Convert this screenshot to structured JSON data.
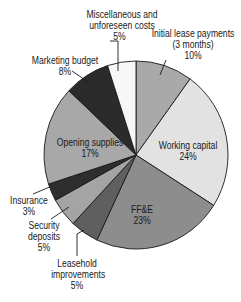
{
  "chart_data": {
    "type": "pie",
    "title": "",
    "start_angle_deg": 0,
    "direction": "clockwise",
    "slices": [
      {
        "label": "Initial lease payments (3 months)",
        "value": 10,
        "pct_text": "10%",
        "color": "#a9a9a9"
      },
      {
        "label": "Working capital",
        "value": 24,
        "pct_text": "24%",
        "color": "#e2e2e2"
      },
      {
        "label": "FF&E",
        "value": 23,
        "pct_text": "23%",
        "color": "#8d8d8d"
      },
      {
        "label": "Leasehold improvements",
        "value": 5,
        "pct_text": "5%",
        "color": "#5f5f5f"
      },
      {
        "label": "Security deposits",
        "value": 5,
        "pct_text": "5%",
        "color": "#a4a4a4"
      },
      {
        "label": "Insurance",
        "value": 3,
        "pct_text": "3%",
        "color": "#2e2e2e"
      },
      {
        "label": "Opening supplies",
        "value": 17,
        "pct_text": "17%",
        "color": "#a8a8a8"
      },
      {
        "label": "Marketing budget",
        "value": 8,
        "pct_text": "8%",
        "color": "#2b2b2b"
      },
      {
        "label": "Miscellaneous and unforeseen costs",
        "value": 5,
        "pct_text": "5%",
        "color": "#f7f7f7"
      }
    ],
    "legend": "none (callout labels)"
  },
  "labels": {
    "lease": {
      "line1": "Initial lease payments",
      "line2": "(3 months)",
      "pct": "10%"
    },
    "working": {
      "line1": "Working capital",
      "pct": "24%"
    },
    "ffe": {
      "line1": "FF&E",
      "pct": "23%"
    },
    "leasehold": {
      "line1": "Leasehold",
      "line2": "improvements",
      "pct": "5%"
    },
    "security": {
      "line1": "Security",
      "line2": "deposits",
      "pct": "5%"
    },
    "insurance": {
      "line1": "Insurance",
      "pct": "3%"
    },
    "opening": {
      "line1": "Opening supplies",
      "pct": "17%"
    },
    "marketing": {
      "line1": "Marketing budget",
      "pct": "8%"
    },
    "misc": {
      "line1": "Miscellaneous and",
      "line2": "unforeseen costs",
      "pct": "5%"
    }
  }
}
